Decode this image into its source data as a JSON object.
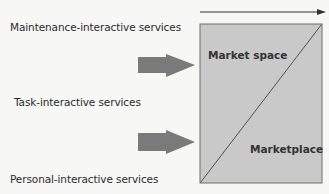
{
  "diagram": {
    "left_labels": [
      {
        "text": "Maintenance-interactive services"
      },
      {
        "text": "Task-interactive services"
      },
      {
        "text": "Personal-interactive services"
      }
    ],
    "box_labels": {
      "upper": "Market space",
      "lower": "Marketplace"
    },
    "colors": {
      "box_fill": "#c9c9c9",
      "box_stroke": "#6e6e6e",
      "arrow_fill": "#7a7a7a",
      "line": "#333333"
    },
    "icons": {
      "top_arrow": "arrow-right-icon",
      "block_arrows": "block-arrow-right-icon"
    }
  }
}
